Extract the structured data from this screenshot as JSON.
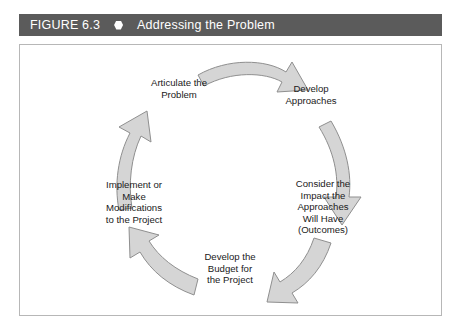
{
  "header": {
    "figure_label": "FIGURE 6.3",
    "bullet_icon": "hexagon-bullet-icon",
    "title": "Addressing the Problem",
    "bar_color": "#5b5b5b",
    "text_color": "#ffffff"
  },
  "figure": {
    "border_color": "#b7b7b7",
    "background_color": "#ffffff"
  },
  "diagram": {
    "type": "cycle",
    "direction": "clockwise",
    "arrow_fill": "#d5d5d5",
    "arrow_stroke": "#8f8f8f",
    "label_color": "#1a1a1a",
    "stages": [
      {
        "id": "articulate-the-problem",
        "label": "Articulate the\nProblem",
        "position": "top-left"
      },
      {
        "id": "develop-approaches",
        "label": "Develop\nApproaches",
        "position": "top-right"
      },
      {
        "id": "consider-the-impact",
        "label": "Consider the\nImpact the\nApproaches\nWill Have\n(Outcomes)",
        "position": "right"
      },
      {
        "id": "develop-the-budget",
        "label": "Develop the\nBudget for\nthe Project",
        "position": "bottom"
      },
      {
        "id": "implement-or-modify",
        "label": "Implement or\nMake\nModifications\nto the Project",
        "position": "left"
      }
    ],
    "arrows": [
      {
        "id": "arrow-top",
        "from": "articulate-the-problem",
        "to": "develop-approaches",
        "points": "right-down"
      },
      {
        "id": "arrow-right",
        "from": "develop-approaches",
        "to": "consider-the-impact",
        "points": "down"
      },
      {
        "id": "arrow-bottom-right",
        "from": "consider-the-impact",
        "to": "develop-the-budget",
        "points": "down-left"
      },
      {
        "id": "arrow-bottom-left",
        "from": "develop-the-budget",
        "to": "implement-or-modify",
        "points": "up-left"
      },
      {
        "id": "arrow-left",
        "from": "implement-or-modify",
        "to": "articulate-the-problem",
        "points": "up"
      }
    ]
  }
}
